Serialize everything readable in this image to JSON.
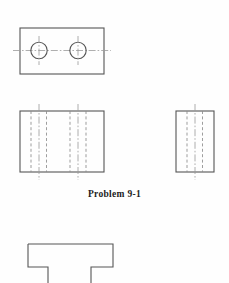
{
  "page": {
    "width": 229,
    "height": 283,
    "background_color": "#fefefe",
    "caption": "Problem 9-1",
    "caption_color": "#1c1c1c"
  },
  "style": {
    "object_line_color": "#555555",
    "hidden_line_color": "#8c8c8c",
    "center_line_color": "#9a9a9a",
    "object_line_width": 1.1,
    "hidden_line_width": 0.85,
    "center_line_width": 0.8,
    "hidden_dash": "3 2.4",
    "center_dash": "7 2 1.6 2"
  },
  "views": {
    "top_view": {
      "name": "Top view with two through holes",
      "rect": {
        "x": 20,
        "y": 28,
        "width": 84,
        "height": 46
      },
      "horizontal_centerline": {
        "x1": 13,
        "y1": 50.5,
        "x2": 111,
        "y2": 50.5
      },
      "holes": [
        {
          "label": "left-hole",
          "cx": 39,
          "cy": 50.5,
          "r": 8.2,
          "vertical_centerline": {
            "x1": 39,
            "y1": 36,
            "x2": 39,
            "y2": 65
          }
        },
        {
          "label": "right-hole",
          "cx": 78,
          "cy": 50.5,
          "r": 8.2,
          "vertical_centerline": {
            "x1": 78,
            "y1": 36,
            "x2": 78,
            "y2": 65
          }
        }
      ]
    },
    "front_view": {
      "name": "Front view with hidden hole lines",
      "rect": {
        "x": 20,
        "y": 111,
        "width": 84,
        "height": 61
      },
      "hidden_lines_x": [
        31,
        46.5,
        70,
        86
      ],
      "hidden_line_top": 111,
      "hidden_line_bottom": 172,
      "center_lines_x": [
        39,
        78
      ],
      "center_line_top": 104,
      "center_line_bottom": 180
    },
    "side_view": {
      "name": "Right side view with hidden hole lines",
      "rect": {
        "x": 176,
        "y": 111,
        "width": 38,
        "height": 61
      },
      "hidden_lines_x": [
        187,
        202.5
      ],
      "hidden_line_top": 111,
      "hidden_line_bottom": 172,
      "center_lines_x": [
        195
      ],
      "center_line_top": 104,
      "center_line_bottom": 180
    },
    "bottom_view": {
      "name": "Partial profile view with notched base",
      "outline_points": "28,244 113,244 113,267 91,267 91,283 48,283 48,267 28,267 28,244"
    }
  }
}
